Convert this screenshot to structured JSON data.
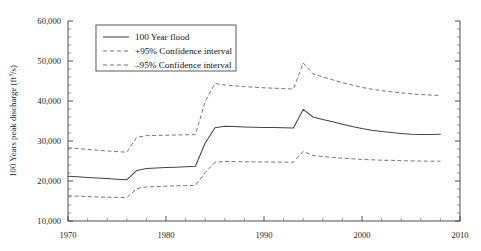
{
  "chart_data": {
    "type": "line",
    "title": "",
    "subtitle": "",
    "xlabel": "",
    "ylabel": "100 Years peak discharge (ft3/s)",
    "ylabel_parts": {
      "prefix": "100 Years peak discharge (ft",
      "superscript": "3",
      "suffix": "/s)"
    },
    "xlim": [
      1970,
      2010
    ],
    "ylim": [
      10000,
      60000
    ],
    "xticks": [
      1970,
      1980,
      1990,
      2000,
      2010
    ],
    "xtick_labels": [
      "1970",
      "1980",
      "1990",
      "2000",
      "2010"
    ],
    "xtick_minor_step": 2,
    "yticks": [
      10000,
      20000,
      30000,
      40000,
      50000,
      60000
    ],
    "ytick_labels": [
      "10,000",
      "20,000",
      "30,000",
      "40,000",
      "50,000",
      "60,000"
    ],
    "ytick_minor_step": 2000,
    "grid": false,
    "legend_position": "top-left",
    "x": [
      1970,
      1971,
      1972,
      1973,
      1974,
      1975,
      1976,
      1977,
      1978,
      1979,
      1980,
      1981,
      1982,
      1983,
      1984,
      1985,
      1986,
      1987,
      1988,
      1989,
      1990,
      1991,
      1992,
      1993,
      1994,
      1995,
      1996,
      1997,
      1998,
      1999,
      2000,
      2001,
      2002,
      2003,
      2004,
      2005,
      2006,
      2007,
      2008
    ],
    "series": [
      {
        "name": "100 Year flood",
        "style": "solid",
        "color": "#444444",
        "values": [
          21200,
          21050,
          20900,
          20750,
          20600,
          20450,
          20300,
          22600,
          23100,
          23250,
          23350,
          23450,
          23550,
          23700,
          29500,
          33300,
          33700,
          33600,
          33500,
          33450,
          33400,
          33350,
          33300,
          33250,
          37900,
          36000,
          35400,
          34800,
          34200,
          33600,
          33100,
          32700,
          32400,
          32150,
          31900,
          31700,
          31600,
          31650,
          31700
        ]
      },
      {
        "name": "+95% Confidence interval",
        "style": "dashed",
        "color": "#6f6f6f",
        "values": [
          28300,
          28100,
          27900,
          27700,
          27500,
          27350,
          27200,
          30900,
          31350,
          31400,
          31450,
          31500,
          31550,
          31600,
          39900,
          44400,
          44000,
          43800,
          43600,
          43450,
          43300,
          43200,
          43100,
          43000,
          49500,
          46800,
          46000,
          45300,
          44600,
          44000,
          43400,
          42950,
          42600,
          42300,
          42050,
          41800,
          41600,
          41500,
          41400
        ]
      },
      {
        "name": "-95% Confidence interval",
        "style": "dashed",
        "color": "#6f6f6f",
        "values": [
          16300,
          16200,
          16100,
          16000,
          15950,
          15900,
          15850,
          18100,
          18500,
          18600,
          18700,
          18800,
          18850,
          18900,
          22100,
          24700,
          24900,
          24850,
          24800,
          24780,
          24760,
          24740,
          24720,
          24700,
          27400,
          26400,
          26100,
          25900,
          25700,
          25550,
          25400,
          25300,
          25200,
          25150,
          25080,
          25020,
          24980,
          24960,
          24950
        ]
      }
    ],
    "legend": [
      {
        "label": "100 Year flood",
        "style": "solid"
      },
      {
        "label": "+95% Confidence interval",
        "style": "dashed"
      },
      {
        "label": "–95% Confidence interval",
        "style": "dashed"
      }
    ]
  }
}
